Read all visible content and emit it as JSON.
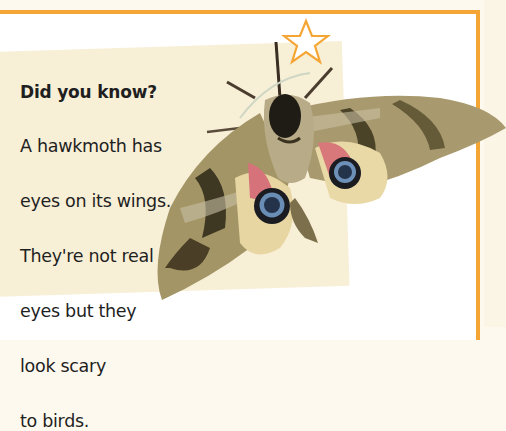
{
  "fact_box": {
    "title": "Did you know?",
    "lines": [
      "A hawkmoth has",
      "eyes on its wings.",
      "They're not real",
      "eyes but they",
      "look scary",
      "to birds."
    ]
  },
  "decorations": {
    "star_icon": "star-outline-icon",
    "image": "hawkmoth-illustration"
  },
  "colors": {
    "accent_orange": "#f5a533",
    "panel_beige": "#f8efd7",
    "page_white": "#ffffff",
    "text": "#1f1f1f"
  }
}
